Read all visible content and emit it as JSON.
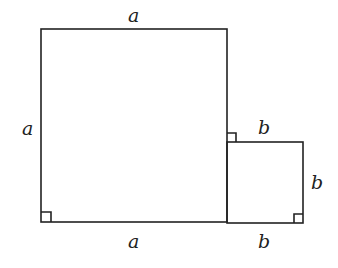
{
  "diagram": {
    "big_square": {
      "side_label": "a",
      "labels": {
        "top": "a",
        "left": "a",
        "bottom": "a"
      }
    },
    "small_square": {
      "side_label": "b",
      "labels": {
        "top": "b",
        "right": "b",
        "bottom": "b"
      }
    },
    "colors": {
      "stroke": "#222222",
      "background": "#ffffff"
    }
  }
}
